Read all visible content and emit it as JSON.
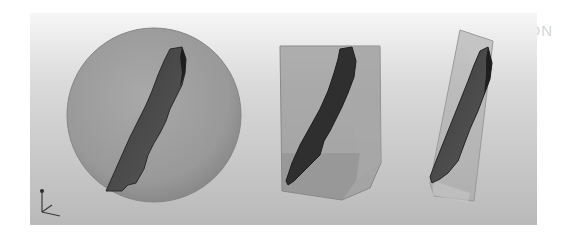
{
  "figure": {
    "background_caption": "THE FLEXIBLE DISTANCE CALCULATION",
    "panels": [
      {
        "id": "sphere",
        "label": "Bounding sphere"
      },
      {
        "id": "aabb",
        "label": "Axis-aligned bounding box"
      },
      {
        "id": "obb",
        "label": "Oriented bounding box"
      }
    ],
    "axis_triad": "xyz-axes",
    "colors": {
      "viewport_top": "#f6f6f6",
      "viewport_bottom": "#b9b9b9",
      "sphere_fill": "#9d9d9d",
      "box_fill": "#8f8f8f",
      "fragment_fill": "#4a4a4a",
      "fragment_edge": "#1e1e1e"
    }
  }
}
